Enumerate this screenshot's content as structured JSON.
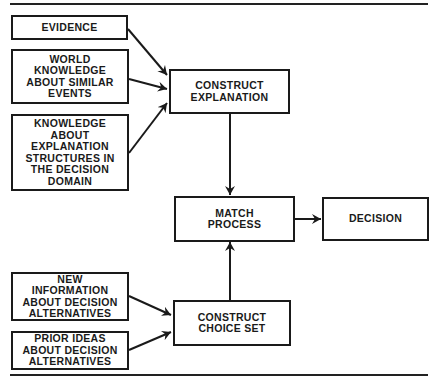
{
  "diagram": {
    "nodes": {
      "evidence": "EVIDENCE",
      "world_knowledge": "WORLD\nKNOWLEDGE\nABOUT SIMILAR\nEVENTS",
      "explanation_knowledge": "KNOWLEDGE\nABOUT\nEXPLANATION\nSTRUCTURES IN\nTHE DECISION\nDOMAIN",
      "construct_explanation": "CONSTRUCT\nEXPLANATION",
      "match_process": "MATCH\nPROCESS",
      "decision": "DECISION",
      "new_information": "NEW\nINFORMATION\nABOUT DECISION\nALTERNATIVES",
      "prior_ideas": "PRIOR IDEAS\nABOUT DECISION\nALTERNATIVES",
      "construct_choice_set": "CONSTRUCT\nCHOICE SET"
    },
    "edges": [
      {
        "from": "evidence",
        "to": "construct_explanation"
      },
      {
        "from": "world_knowledge",
        "to": "construct_explanation"
      },
      {
        "from": "explanation_knowledge",
        "to": "construct_explanation"
      },
      {
        "from": "construct_explanation",
        "to": "match_process"
      },
      {
        "from": "match_process",
        "to": "decision"
      },
      {
        "from": "new_information",
        "to": "construct_choice_set"
      },
      {
        "from": "prior_ideas",
        "to": "construct_choice_set"
      },
      {
        "from": "construct_choice_set",
        "to": "match_process"
      }
    ]
  }
}
